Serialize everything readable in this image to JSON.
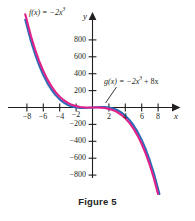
{
  "figure": {
    "caption": "Figure 5",
    "background_color": "#ffffff",
    "axis_color": "#231f20"
  },
  "axes": {
    "x_axis_name": "x",
    "y_axis_name": "y",
    "x_tick_labels": [
      "−8",
      "−6",
      "−4",
      "−2",
      "2",
      "4",
      "6",
      "8"
    ],
    "y_tick_labels": [
      "800",
      "600",
      "400",
      "200",
      "−200",
      "−400",
      "−600",
      "−800"
    ]
  },
  "labels": {
    "f_prefix": "f(x) = −2x",
    "f_exponent": "3",
    "g_prefix": "g(x) = −2x",
    "g_exponent": "3",
    "g_suffix": " + 8x"
  },
  "chart_data": {
    "type": "line",
    "title": "Figure 5",
    "xlabel": "x",
    "ylabel": "y",
    "xlim": [
      -9,
      9
    ],
    "ylim": [
      -900,
      900
    ],
    "xticks": [
      -8,
      -6,
      -4,
      -2,
      2,
      4,
      6,
      8
    ],
    "yticks": [
      -800,
      -600,
      -400,
      -200,
      200,
      400,
      600,
      800
    ],
    "grid": false,
    "legend": "inline-annotations",
    "series": [
      {
        "name": "f(x) = -2x^3",
        "color": "#e0218a",
        "equation": "y = -2*x^3",
        "x": [
          -8.2,
          -7.5,
          -7,
          -6.5,
          -6,
          -5.5,
          -5,
          -4.5,
          -4,
          -3.5,
          -3,
          -2.5,
          -2,
          -1.5,
          -1,
          -0.5,
          0,
          0.5,
          1,
          1.5,
          2,
          2.5,
          3,
          3.5,
          4,
          4.5,
          5,
          5.5,
          6,
          6.5,
          7,
          7.5,
          8.2
        ],
        "y": [
          1103.0,
          843.8,
          686.0,
          549.3,
          432.0,
          332.8,
          250.0,
          182.3,
          128.0,
          85.8,
          54.0,
          31.3,
          16.0,
          6.8,
          2.0,
          0.3,
          0.0,
          -0.3,
          -2.0,
          -6.8,
          -16.0,
          -31.3,
          -54.0,
          -85.8,
          -128.0,
          -182.3,
          -250.0,
          -332.8,
          -432.0,
          -549.3,
          -686.0,
          -843.8,
          -1103.0
        ]
      },
      {
        "name": "g(x) = -2x^3 + 8x",
        "color": "#2b6cb8",
        "equation": "y = -2*x^3 + 8*x",
        "x": [
          -8.2,
          -7.5,
          -7,
          -6.5,
          -6,
          -5.5,
          -5,
          -4.5,
          -4,
          -3.5,
          -3,
          -2.5,
          -2,
          -1.5,
          -1,
          -0.5,
          0,
          0.5,
          1,
          1.5,
          2,
          2.5,
          3,
          3.5,
          4,
          4.5,
          5,
          5.5,
          6,
          6.5,
          7,
          7.5,
          8.2
        ],
        "y": [
          1037.4,
          783.8,
          630.0,
          497.3,
          384.0,
          288.8,
          210.0,
          146.3,
          96.0,
          57.8,
          30.0,
          11.3,
          0.0,
          -5.2,
          -6.0,
          -3.7,
          0.0,
          3.7,
          6.0,
          5.2,
          0.0,
          -11.3,
          -30.0,
          -57.8,
          -96.0,
          -146.3,
          -210.0,
          -288.8,
          -384.0,
          -497.3,
          -630.0,
          -783.8,
          -1037.4
        ]
      }
    ],
    "annotations": [
      {
        "text": "f(x) = -2x^3",
        "target_series": "f(x) = -2x^3",
        "position": "upper-left"
      },
      {
        "text": "g(x) = -2x^3 + 8x",
        "target_series": "g(x) = -2x^3 + 8x",
        "position": "right-of-origin",
        "has_leader_line": true
      }
    ]
  }
}
